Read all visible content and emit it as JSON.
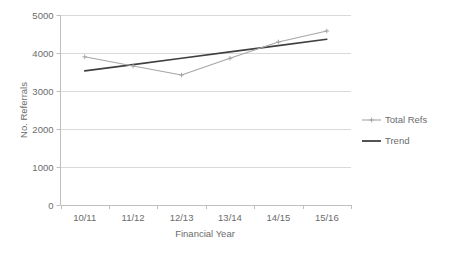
{
  "chart_data": {
    "type": "line",
    "title": "",
    "xlabel": "Financial Year",
    "ylabel": "No. Referrals",
    "categories": [
      "10/11",
      "11/12",
      "12/13",
      "13/14",
      "14/15",
      "15/16"
    ],
    "ylim": [
      0,
      5000
    ],
    "yticks": [
      0,
      1000,
      2000,
      3000,
      4000,
      5000
    ],
    "ytick_labels": [
      "0",
      "1000",
      "2000",
      "3000",
      "4000",
      "5000"
    ],
    "grid": true,
    "legend_position": "right",
    "series": [
      {
        "name": "Total Refs",
        "color": "#a6a6a6",
        "marker": "plus",
        "values": [
          3900,
          3660,
          3420,
          3860,
          4290,
          4580
        ]
      },
      {
        "name": "Trend",
        "color": "#404040",
        "marker": "none",
        "values": [
          3530,
          3695,
          3860,
          4030,
          4195,
          4360
        ]
      }
    ]
  },
  "axis": {
    "y_title": "No. Referrals",
    "x_title": "Financial Year"
  },
  "legend": {
    "items": [
      {
        "label": "Total Refs",
        "color": "#a6a6a6"
      },
      {
        "label": "Trend",
        "color": "#404040"
      }
    ]
  },
  "colors": {
    "total_refs": "#a6a6a6",
    "trend": "#404040",
    "gridline": "#d9d9d9",
    "axis": "#bfbfbf",
    "text": "#6b6b6b",
    "background": "#ffffff"
  }
}
